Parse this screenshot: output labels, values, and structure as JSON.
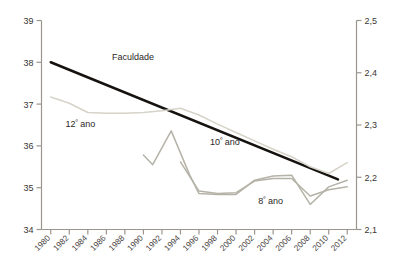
{
  "chart_data": {
    "type": "line",
    "title": "",
    "subtitle": "",
    "xlabel": "",
    "ylabel": "",
    "y2label": "",
    "xlim": [
      1979,
      2013
    ],
    "ylim": [
      34,
      39
    ],
    "y2lim": [
      2.1,
      2.5
    ],
    "grid": false,
    "legend": "inline-annotations",
    "x_ticks": [
      "1980",
      "1982",
      "1984",
      "1986",
      "1988",
      "1990",
      "1992",
      "1994",
      "1996",
      "1998",
      "2000",
      "2002",
      "2004",
      "2006",
      "2008",
      "2010",
      "2012"
    ],
    "y_ticks_left": [
      "34",
      "35",
      "36",
      "37",
      "38",
      "39"
    ],
    "y_ticks_right": [
      "2,1",
      "2,2",
      "2,3",
      "2,4",
      "2,5"
    ],
    "series": [
      {
        "name": "Faculdade",
        "color": "#16120f",
        "width": 2.6,
        "axis": "left",
        "label_x": 1986.6,
        "label_y": 38.05,
        "x": [
          1980,
          2011
        ],
        "values": [
          38.0,
          35.2
        ]
      },
      {
        "name": "12º ano",
        "color": "#d6d3c8",
        "width": 1.5,
        "axis": "left",
        "label_x": 1981.6,
        "label_y": 36.45,
        "x": [
          1980,
          1982,
          1984,
          1986,
          1988,
          1990,
          1992,
          1994,
          1996,
          1998,
          2000,
          2002,
          2004,
          2006,
          2008,
          2010,
          2012
        ],
        "values": [
          37.17,
          37.02,
          36.8,
          36.78,
          36.78,
          36.8,
          36.84,
          36.9,
          36.74,
          36.52,
          36.32,
          36.12,
          35.92,
          35.74,
          35.5,
          35.34,
          35.6
        ]
      },
      {
        "name": "10º ano",
        "color": "#b5b3a8",
        "width": 1.5,
        "axis": "left",
        "label_x": 1997.2,
        "label_y": 36.02,
        "x": [
          1990,
          1991,
          1993,
          1995,
          1996,
          1998,
          2000,
          2002,
          2004,
          2006,
          2008,
          2010,
          2012
        ],
        "values": [
          35.78,
          35.55,
          36.36,
          35.3,
          34.86,
          34.84,
          34.84,
          35.18,
          35.28,
          35.3,
          34.6,
          35.02,
          35.18
        ]
      },
      {
        "name": "8º ano",
        "color": "#b5b3a8",
        "width": 1.5,
        "axis": "left",
        "label_x": 2002.4,
        "label_y": 34.62,
        "x": [
          1994,
          1996,
          1998,
          2000,
          2002,
          2004,
          2006,
          2008,
          2010,
          2012
        ],
        "values": [
          35.62,
          34.92,
          34.86,
          34.88,
          35.16,
          35.22,
          35.22,
          34.8,
          34.95,
          35.02
        ]
      }
    ],
    "axis_color": "#9a968e",
    "tick_color": "#9a968e",
    "text_color": "#3a3634",
    "background": "#ffffff"
  },
  "axes": {
    "left_ticks": [
      {
        "label": "39"
      },
      {
        "label": "38"
      },
      {
        "label": "37"
      },
      {
        "label": "36"
      },
      {
        "label": "35"
      },
      {
        "label": "34"
      }
    ],
    "right_ticks": [
      {
        "label": "2,5"
      },
      {
        "label": "2,4"
      },
      {
        "label": "2,3"
      },
      {
        "label": "2,2"
      },
      {
        "label": "2,1"
      }
    ],
    "x_ticks": [
      {
        "label": "1980"
      },
      {
        "label": "1982"
      },
      {
        "label": "1984"
      },
      {
        "label": "1986"
      },
      {
        "label": "1988"
      },
      {
        "label": "1990"
      },
      {
        "label": "1992"
      },
      {
        "label": "1994"
      },
      {
        "label": "1996"
      },
      {
        "label": "1998"
      },
      {
        "label": "2000"
      },
      {
        "label": "2002"
      },
      {
        "label": "2004"
      },
      {
        "label": "2006"
      },
      {
        "label": "2008"
      },
      {
        "label": "2010"
      },
      {
        "label": "2012"
      }
    ]
  },
  "annotations": {
    "faculdade": "Faculdade",
    "ano12_num": "12",
    "ano12_sup": "º",
    "ano12_word": "ano",
    "ano10_num": "10",
    "ano10_sup": "º",
    "ano10_word": "ano",
    "ano8_num": "8",
    "ano8_sup": "º",
    "ano8_word": "ano"
  }
}
